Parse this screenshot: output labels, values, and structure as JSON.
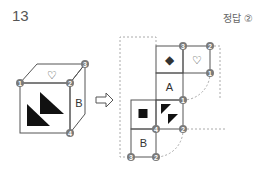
{
  "header": {
    "question_number": "13",
    "answer_label": "정답 ②"
  },
  "cube": {
    "top_face_symbol": "♡",
    "right_face_label": "B",
    "front_face_symbol": "two-black-triangles",
    "vertex_labels": [
      "1",
      "2",
      "3",
      "4"
    ]
  },
  "arrow": "⇨",
  "net": {
    "cells": [
      {
        "row": 0,
        "col": 1,
        "symbol": "◆"
      },
      {
        "row": 0,
        "col": 2,
        "symbol": "♡"
      },
      {
        "row": 1,
        "col": 1,
        "symbol": "A"
      },
      {
        "row": 2,
        "col": 0,
        "symbol": "■"
      },
      {
        "row": 2,
        "col": 1,
        "symbol": "two-black-triangles"
      },
      {
        "row": 3,
        "col": 0,
        "symbol": "B"
      }
    ],
    "vertex_labels": {
      "top_mid": "3",
      "top_right": "2",
      "right_mid": "1",
      "center_right": "1",
      "row3_mid": "4",
      "row3_right": "2",
      "bottom_left": "3",
      "bottom_mid": "2"
    }
  },
  "colors": {
    "line": "#555555",
    "badge": "#7a7a7a",
    "dashed": "#aaaaaa",
    "fill": "#111111"
  }
}
